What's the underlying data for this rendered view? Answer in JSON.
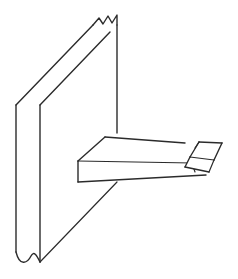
{
  "drawing": {
    "title": "Wall-Mounted Triangular Shelf Bracket",
    "subject": "pictorial line drawing",
    "projection": "oblique",
    "background_color": "#ffffff",
    "line_color": "#2b2b2b",
    "face_fill": "#ffffff",
    "stroke_width": 1.4,
    "thin_stroke_width": 1.1,
    "canvas": {
      "width": 238,
      "height": 279
    },
    "parts": [
      {
        "id": "wall-slab",
        "label": "Wall Slab",
        "description": "Vertical flat panel shown partially, terminated by break lines at top and bottom",
        "faces": [
          {
            "id": "wall-front-face",
            "label": "Wall Front Face",
            "points": "16,105 40,105 40,258 16,258"
          },
          {
            "id": "wall-top-face",
            "label": "Wall Top Edge Face",
            "points": "16,105 40,105 117,25 93,25"
          },
          {
            "id": "wall-side-face",
            "label": "Wall Side Face",
            "points": "40,105 117,25 117,258 40,258"
          }
        ],
        "edges": [
          {
            "id": "wall-left-vertical",
            "label": "Wall Left Vertical Edge",
            "path": "M16,105 L16,252"
          },
          {
            "id": "wall-front-corner-vertical",
            "label": "Wall Front Corner Vertical Edge",
            "path": "M40,105 L40,262"
          },
          {
            "id": "wall-right-vertical",
            "label": "Wall Right Vertical Edge",
            "path": "M117,25 L117,133"
          },
          {
            "id": "wall-top-left-diagonal",
            "label": "Wall Top Left Diagonal Edge",
            "path": "M16,105 L93,25"
          },
          {
            "id": "wall-top-right-diagonal",
            "label": "Wall Top Right Diagonal Edge",
            "path": "M40,105 L110,32"
          },
          {
            "id": "wall-bottom-diagonal",
            "label": "Wall Bottom Diagonal Edge",
            "path": "M40,262 L117,182"
          }
        ],
        "break_lines": [
          {
            "id": "top-break-line",
            "label": "Top Break Line (jagged)",
            "path": "M93,25 L99,18 L103,24 L108,16 L112,23 L117,15 L117,25"
          },
          {
            "id": "bottom-break-line",
            "label": "Bottom Break Line (wavy)",
            "path": "M16,252 C20,268 28,262 31,256 C34,250 37,256 40,262"
          }
        ]
      },
      {
        "id": "bracket-gusset",
        "label": "Triangular Bracket Gusset",
        "description": "Wedge-shaped support projecting horizontally from the wall",
        "faces": [
          {
            "id": "bracket-top-face",
            "label": "Bracket Top Face",
            "points": "105,137 78,161 192,163 185,143"
          },
          {
            "id": "bracket-front-face",
            "label": "Bracket Front Edge Face",
            "points": "78,161 78,182 206,175 192,163"
          }
        ],
        "edges": [
          {
            "id": "bracket-top-back-edge",
            "label": "Bracket Top Back Edge",
            "path": "M105,137 L185,143"
          },
          {
            "id": "bracket-top-left-edge",
            "label": "Bracket Top Left Edge",
            "path": "M105,137 L78,161"
          },
          {
            "id": "bracket-top-front-edge",
            "label": "Bracket Top Front Edge",
            "path": "M78,161 L192,163"
          },
          {
            "id": "bracket-left-vertical-edge",
            "label": "Bracket Left Vertical Edge",
            "path": "M78,161 L78,182"
          },
          {
            "id": "bracket-bottom-front-edge",
            "label": "Bracket Bottom Front Edge",
            "path": "M78,182 L206,175"
          },
          {
            "id": "bracket-right-face-edge",
            "label": "Bracket Right Face Edge",
            "path": "M192,163 L195,172"
          }
        ]
      },
      {
        "id": "end-block",
        "label": "Angled End Block",
        "description": "Small rectangular block attached at the outer tip of the bracket",
        "faces": [
          {
            "id": "block-top-face",
            "label": "End Block Top Face",
            "points": "199,142 222,143 214,160 190,157"
          },
          {
            "id": "block-front-face",
            "label": "End Block Front Face",
            "points": "190,157 214,160 209,172 185,167"
          },
          {
            "id": "block-right-face",
            "label": "End Block Right Face",
            "points": "222,143 214,160 209,172 217,155"
          }
        ],
        "edges": [
          {
            "id": "block-top-back-edge",
            "label": "End Block Top Back Edge",
            "path": "M199,142 L222,143"
          },
          {
            "id": "block-top-left-edge",
            "label": "End Block Top Left Edge",
            "path": "M199,142 L190,157"
          },
          {
            "id": "block-top-front-edge",
            "label": "End Block Top Front Edge",
            "path": "M190,157 L214,160"
          },
          {
            "id": "block-top-right-edge",
            "label": "End Block Top Right Edge",
            "path": "M222,143 L214,160"
          },
          {
            "id": "block-front-left-edge",
            "label": "End Block Front Left Edge",
            "path": "M190,157 L185,167"
          },
          {
            "id": "block-front-bottom-edge",
            "label": "End Block Front Bottom Edge",
            "path": "M185,167 L209,172"
          },
          {
            "id": "block-right-bottom-edge",
            "label": "End Block Right Bottom Edge",
            "path": "M214,160 L209,172"
          },
          {
            "id": "block-inner-seam",
            "label": "End Block Inner Seam",
            "path": "M199,142 L196,147"
          }
        ]
      }
    ]
  }
}
